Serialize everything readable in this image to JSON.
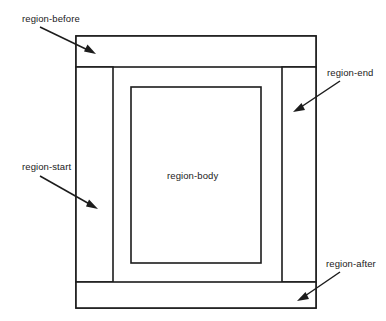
{
  "diagram": {
    "type": "nested-box-diagram",
    "colors": {
      "stroke": "#1c1c1c",
      "fill": "#ffffff",
      "text": "#1a1a1a",
      "background": "#ffffff"
    },
    "regions": [
      {
        "id": "region-before",
        "label": "region-before",
        "placement": "top-band",
        "rect": {
          "x": 76,
          "y": 36,
          "w": 240,
          "h": 31
        }
      },
      {
        "id": "region-start",
        "label": "region-start",
        "placement": "left-column",
        "rect": {
          "x": 76,
          "y": 67,
          "w": 37,
          "h": 215
        }
      },
      {
        "id": "region-body",
        "label": "region-body",
        "placement": "center",
        "rect": {
          "x": 131,
          "y": 87,
          "w": 130,
          "h": 176
        }
      },
      {
        "id": "region-end",
        "label": "region-end",
        "placement": "right-column",
        "rect": {
          "x": 282,
          "y": 67,
          "w": 34,
          "h": 215
        }
      },
      {
        "id": "region-after",
        "label": "region-after",
        "placement": "bottom-band",
        "rect": {
          "x": 76,
          "y": 282,
          "w": 240,
          "h": 26
        }
      }
    ],
    "callouts": [
      {
        "id": "callout-region-before",
        "label": "region-before",
        "label_pos": {
          "x": 22,
          "y": 13
        },
        "arrow_from": {
          "x": 40,
          "y": 27
        },
        "arrow_to": {
          "x": 95,
          "y": 54
        }
      },
      {
        "id": "callout-region-end",
        "label": "region-end",
        "label_pos": {
          "x": 327,
          "y": 67
        },
        "arrow_from": {
          "x": 340,
          "y": 81
        },
        "arrow_to": {
          "x": 294,
          "y": 112
        }
      },
      {
        "id": "callout-region-start",
        "label": "region-start",
        "label_pos": {
          "x": 22,
          "y": 161
        },
        "arrow_from": {
          "x": 40,
          "y": 176
        },
        "arrow_to": {
          "x": 97,
          "y": 209
        }
      },
      {
        "id": "callout-region-after",
        "label": "region-after",
        "label_pos": {
          "x": 326,
          "y": 258
        },
        "arrow_from": {
          "x": 340,
          "y": 272
        },
        "arrow_to": {
          "x": 298,
          "y": 301
        }
      }
    ],
    "inline_labels": [
      {
        "id": "label-region-body",
        "label": "region-body",
        "pos": {
          "x": 167,
          "y": 170
        }
      }
    ]
  }
}
